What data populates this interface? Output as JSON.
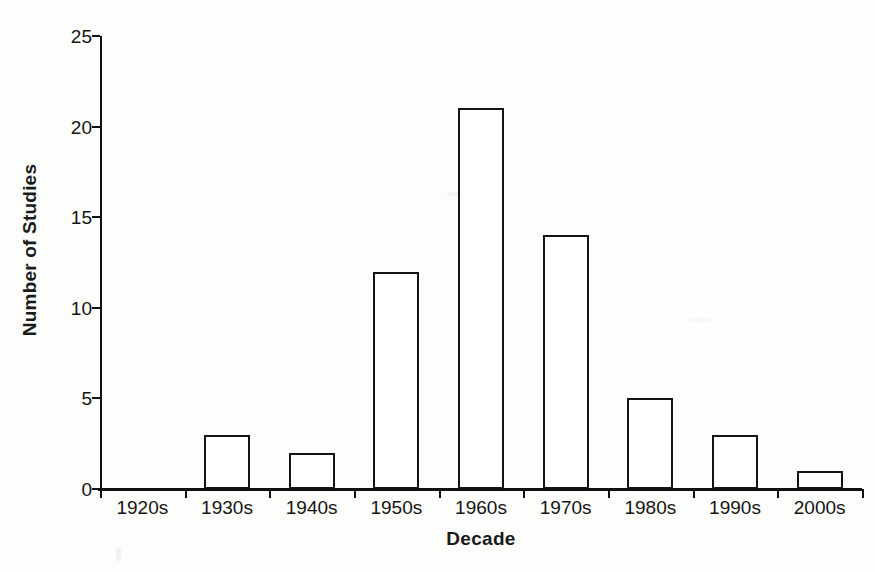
{
  "chart_data": {
    "type": "bar",
    "title": "",
    "xlabel": "Decade",
    "ylabel": "Number of Studies",
    "categories": [
      "1920s",
      "1930s",
      "1940s",
      "1950s",
      "1960s",
      "1970s",
      "1980s",
      "1990s",
      "2000s"
    ],
    "values": [
      0,
      3,
      2,
      12,
      21,
      14,
      5,
      3,
      1
    ],
    "ylim": [
      0,
      25
    ],
    "yticks": [
      0,
      5,
      10,
      15,
      20,
      25
    ],
    "ytick_labels": [
      "0",
      "5",
      "10",
      "15",
      "20",
      "25"
    ],
    "grid": false,
    "legend": false,
    "legend_position": "none",
    "bar_fill_color": "#ffffff",
    "bar_edge_color": "#141414",
    "axis_color": "#111111",
    "background_color": "#fdfdfc",
    "text_color": "#141414"
  },
  "axes": {
    "y_title": "Number of Studies",
    "x_title": "Decade"
  }
}
